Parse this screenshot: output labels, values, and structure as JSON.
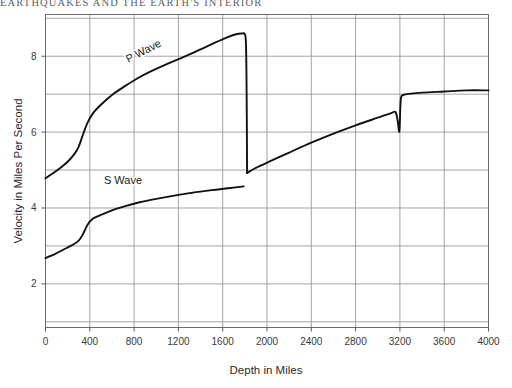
{
  "page": {
    "running_header": "EARTHQUAKES AND THE EARTH'S INTERIOR"
  },
  "chart_data": {
    "type": "line",
    "title": "",
    "xlabel": "Depth in Miles",
    "ylabel": "Velocity in Miles Per Second",
    "xlim": [
      0,
      4000
    ],
    "ylim": [
      0.85,
      9.1
    ],
    "xticks": [
      0,
      400,
      800,
      1200,
      1600,
      2000,
      2400,
      2800,
      3200,
      3600,
      4000
    ],
    "xticklabels": [
      "0",
      "400",
      "800",
      "1200",
      "1600",
      "2000",
      "2400",
      "2800",
      "3200",
      "3600",
      "4000"
    ],
    "yticks": [
      2,
      4,
      6,
      8
    ],
    "yticklabels": [
      "2",
      "4",
      "6",
      "8"
    ],
    "grid": "both",
    "grid_x_step": 400,
    "grid_y_step": 1,
    "legend_position": "inline-annotation",
    "series": [
      {
        "name": "P Wave",
        "label": "P Wave",
        "label_x": 900,
        "label_y": 8.05,
        "label_rotation": -27,
        "segments": [
          {
            "comment": "mantle: rise from surface to core-mantle boundary",
            "points": [
              [
                0,
                4.78
              ],
              [
                60,
                4.9
              ],
              [
                130,
                5.05
              ],
              [
                200,
                5.22
              ],
              [
                260,
                5.42
              ],
              [
                300,
                5.62
              ],
              [
                340,
                5.95
              ],
              [
                380,
                6.25
              ],
              [
                430,
                6.5
              ],
              [
                500,
                6.72
              ],
              [
                600,
                6.98
              ],
              [
                700,
                7.18
              ],
              [
                820,
                7.4
              ],
              [
                950,
                7.6
              ],
              [
                1100,
                7.8
              ],
              [
                1250,
                7.98
              ],
              [
                1400,
                8.18
              ],
              [
                1530,
                8.36
              ],
              [
                1640,
                8.5
              ],
              [
                1720,
                8.58
              ],
              [
                1770,
                8.6
              ],
              [
                1800,
                8.58
              ],
              [
                1810,
                8.35
              ],
              [
                1815,
                7.4
              ],
              [
                1818,
                6.2
              ],
              [
                1820,
                4.92
              ]
            ]
          },
          {
            "comment": "outer core: slow rise then small drop at inner core boundary",
            "points": [
              [
                1820,
                4.92
              ],
              [
                1900,
                5.06
              ],
              [
                2050,
                5.26
              ],
              [
                2200,
                5.46
              ],
              [
                2400,
                5.72
              ],
              [
                2600,
                5.96
              ],
              [
                2800,
                6.18
              ],
              [
                3000,
                6.38
              ],
              [
                3120,
                6.5
              ],
              [
                3160,
                6.53
              ],
              [
                3180,
                6.3
              ],
              [
                3195,
                6.02
              ],
              [
                3205,
                6.72
              ],
              [
                3215,
                6.95
              ],
              [
                3260,
                7.0
              ],
              [
                3400,
                7.04
              ],
              [
                3600,
                7.07
              ],
              [
                3800,
                7.1
              ],
              [
                4000,
                7.1
              ]
            ]
          }
        ]
      },
      {
        "name": "S Wave",
        "label": "S Wave",
        "label_x": 700,
        "label_y": 4.62,
        "label_rotation": 0,
        "segments": [
          {
            "comment": "mantle only: S waves do not travel through liquid outer core",
            "points": [
              [
                0,
                2.68
              ],
              [
                80,
                2.78
              ],
              [
                160,
                2.9
              ],
              [
                240,
                3.02
              ],
              [
                300,
                3.14
              ],
              [
                340,
                3.32
              ],
              [
                380,
                3.56
              ],
              [
                430,
                3.72
              ],
              [
                500,
                3.82
              ],
              [
                600,
                3.94
              ],
              [
                720,
                4.05
              ],
              [
                850,
                4.15
              ],
              [
                1000,
                4.24
              ],
              [
                1150,
                4.32
              ],
              [
                1320,
                4.4
              ],
              [
                1500,
                4.47
              ],
              [
                1650,
                4.52
              ],
              [
                1790,
                4.57
              ]
            ]
          }
        ]
      }
    ],
    "annotations": [
      {
        "name": "core-mantle-boundary-discontinuity",
        "depth": 1800,
        "description": "P wave velocity drops sharply; S wave terminates"
      },
      {
        "name": "inner-core-boundary-discontinuity",
        "depth": 3200,
        "description": "P wave velocity dips then jumps"
      }
    ]
  }
}
